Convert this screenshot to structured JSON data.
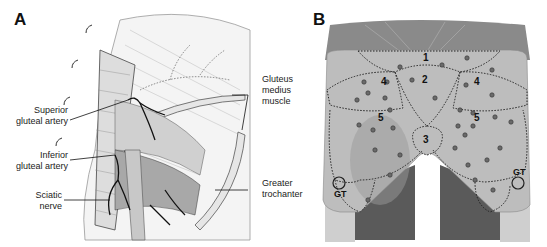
{
  "figure": {
    "panels": [
      {
        "id": "A",
        "letter": "A",
        "title": "Gluteal anatomy dissection",
        "labels": {
          "superior_gluteal_artery": "Superior\ngluteal artery",
          "inferior_gluteal_artery": "Inferior\ngluteal artery",
          "sciatic_nerve": "Sciatic\nnerve",
          "gluteus_medius_muscle": "Gluteus\nmedius\nmuscle",
          "greater_trochanter": "Greater\ntrochanter"
        }
      },
      {
        "id": "B",
        "letter": "B",
        "title": "Gluteal zones with perforator vessels",
        "zones": [
          "1",
          "2",
          "3",
          "4",
          "4",
          "5",
          "5"
        ],
        "zone_labels": {
          "z1": "1",
          "z2": "2",
          "z3": "3",
          "z4_left": "4",
          "z4_right": "4",
          "z5_left": "5",
          "z5_right": "5"
        },
        "landmarks": {
          "gt_left": "GT",
          "gt_right": "GT"
        }
      }
    ]
  },
  "colors": {
    "line": "#222222",
    "muscle_fill": "#e8e8e8",
    "skin_fill": "#bdbdbd",
    "dark_muscle": "#5a5a5a",
    "nerve": "#c8c8c8"
  }
}
